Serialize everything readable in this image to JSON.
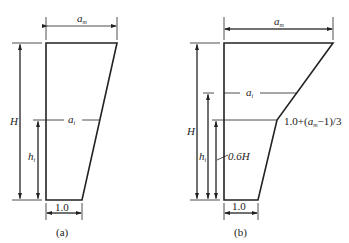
{
  "figure_a": {
    "caption": "(a)",
    "top_width_label": "a",
    "top_width_sub": "m",
    "height_label": "H",
    "level_width_label": "a",
    "level_width_sub": "i",
    "level_height_label": "h",
    "level_height_sub": "i",
    "bottom_width_label": "1.0"
  },
  "figure_b": {
    "caption": "(b)",
    "top_width_label": "a",
    "top_width_sub": "m",
    "height_label": "H",
    "level_width_label": "a",
    "level_width_sub": "i",
    "level_height_label": "h",
    "level_height_sub": "i",
    "knee_label_prefix": "1.0+(",
    "knee_label_var": "a",
    "knee_label_sub": "m",
    "knee_label_suffix": "−1)/3",
    "knee_height_label": "0.6H",
    "bottom_width_label": "1.0"
  }
}
